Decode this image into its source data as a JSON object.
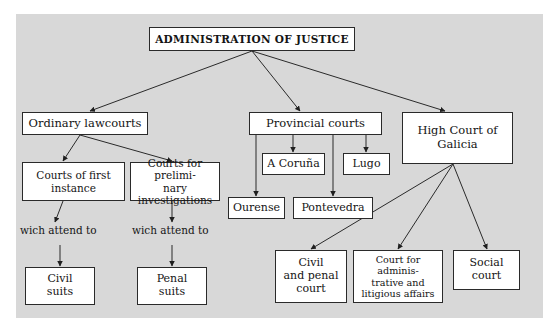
{
  "diagram": {
    "title": "ADMINISTRATION OF JUSTICE",
    "background_color": "#d8d8d8",
    "node_fill": "#ffffff",
    "line_color": "#2a2a2a",
    "root": {
      "label": "ADMINISTRATION OF JUSTICE"
    },
    "branches": {
      "ordinary": {
        "label": "Ordinary lawcourts",
        "children": [
          {
            "label": "Courts of first\ninstance"
          },
          {
            "label": "Courts for prelimi-\nnary investigations"
          }
        ],
        "edge_labels": [
          "wich attend to",
          "wich attend to"
        ],
        "outcomes": [
          {
            "label": "Civil\nsuits"
          },
          {
            "label": "Penal\nsuits"
          }
        ]
      },
      "provincial": {
        "label": "Provincial courts",
        "children": [
          {
            "label": "A Coruña"
          },
          {
            "label": "Lugo"
          },
          {
            "label": "Ourense"
          },
          {
            "label": "Pontevedra"
          }
        ]
      },
      "high_court": {
        "label": "High Court of\nGalicia",
        "children": [
          {
            "label": "Civil\nand penal\ncourt"
          },
          {
            "label": "Court for adminis-\ntrative and\nlitigious affairs"
          },
          {
            "label": "Social\ncourt"
          }
        ]
      }
    }
  }
}
